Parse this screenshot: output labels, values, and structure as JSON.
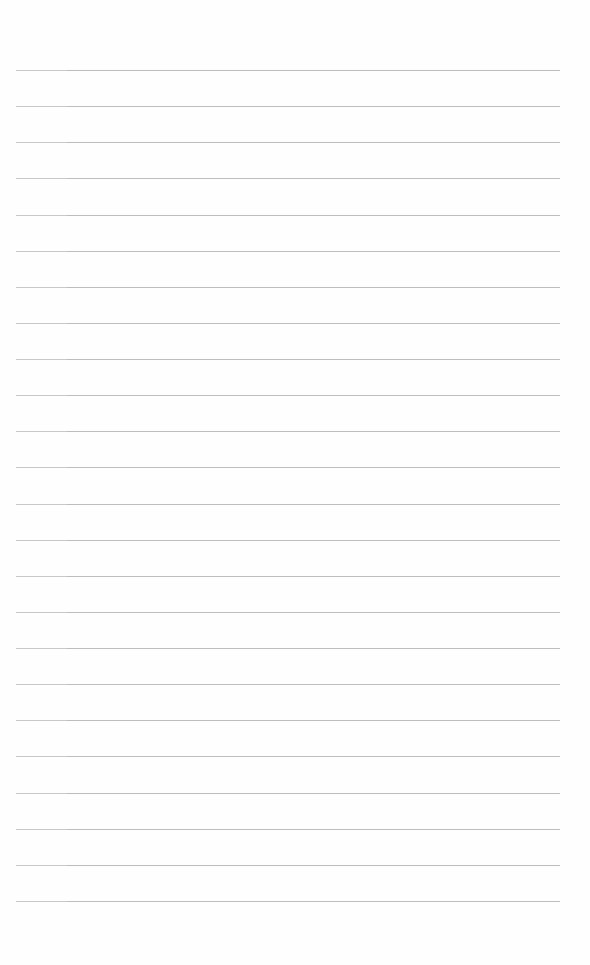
{
  "paper": {
    "type": "lined-paper",
    "background_color": "#fefefe",
    "line_color": "#bdbdbd",
    "line_count": 24,
    "first_line_y": 70,
    "line_spacing": 36.13,
    "line_left": 16,
    "line_right": 560,
    "text": ""
  }
}
